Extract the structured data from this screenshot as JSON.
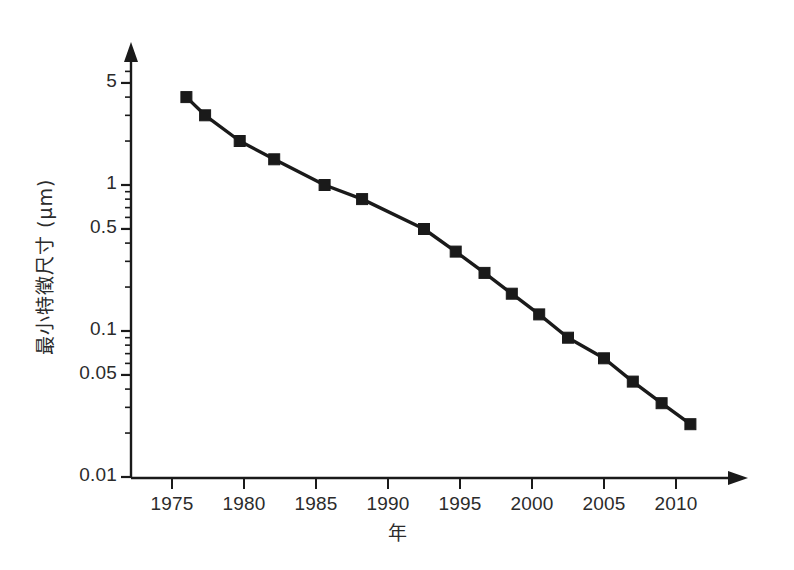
{
  "chart_data": {
    "type": "line",
    "title": "",
    "xlabel": "年",
    "ylabel": "最小特徵尺寸 (μm)",
    "x": [
      1976,
      1977.3,
      1979.7,
      1982.1,
      1985.6,
      1988.2,
      1992.5,
      1994.7,
      1996.7,
      1998.6,
      2000.5,
      2002.5,
      2005,
      2007,
      2009,
      2011
    ],
    "values": [
      4.0,
      3.0,
      2.0,
      1.5,
      1.0,
      0.8,
      0.5,
      0.35,
      0.25,
      0.18,
      0.13,
      0.09,
      0.065,
      0.045,
      0.032,
      0.023
    ],
    "series": [
      {
        "name": "最小特徵尺寸",
        "marker": "square",
        "color": "#1a1a1a",
        "values": [
          4.0,
          3.0,
          2.0,
          1.5,
          1.0,
          0.8,
          0.5,
          0.35,
          0.25,
          0.18,
          0.13,
          0.09,
          0.065,
          0.045,
          0.032,
          0.023
        ]
      }
    ],
    "yscale": "log",
    "xscale": "linear",
    "ylim": [
      0.01,
      7.0
    ],
    "xlim": [
      1972,
      2014
    ],
    "grid": false,
    "legend": false,
    "legend_position": "none",
    "y_tick_labels": [
      "5",
      "1",
      "0.5",
      "0.1",
      "0.05",
      "0.01"
    ],
    "y_tick_values": [
      5,
      1,
      0.5,
      0.1,
      0.05,
      0.01
    ],
    "x_tick_labels": [
      "1975",
      "1980",
      "1985",
      "1990",
      "1995",
      "2000",
      "2005",
      "2010"
    ],
    "x_tick_values": [
      1975,
      1980,
      1985,
      1990,
      1995,
      2000,
      2005,
      2010
    ],
    "axis_color": "#1a1a1a",
    "line_color": "#1a1a1a",
    "background_color": "#ffffff",
    "arrow_axes": true
  }
}
